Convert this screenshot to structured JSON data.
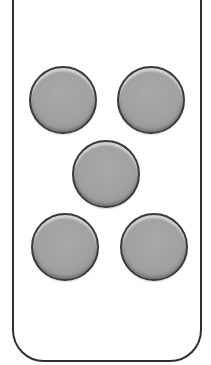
{
  "figure": {
    "colors": {
      "outline": "#2f2f2f",
      "button_fill": "#a1a1a1",
      "button_border": "#3a3a3a",
      "background": "#ffffff"
    },
    "buttons": [
      {
        "id": "top-left",
        "label": ""
      },
      {
        "id": "top-right",
        "label": ""
      },
      {
        "id": "center",
        "label": ""
      },
      {
        "id": "bottom-left",
        "label": ""
      },
      {
        "id": "bottom-right",
        "label": ""
      }
    ]
  }
}
